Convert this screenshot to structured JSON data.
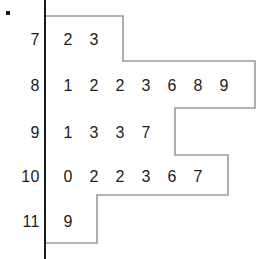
{
  "chart_data": {
    "type": "table",
    "title": "",
    "xlabel": "",
    "ylabel": "",
    "stem_unit": "",
    "rows": [
      {
        "stem": "7",
        "leaves": [
          "2",
          "3"
        ]
      },
      {
        "stem": "8",
        "leaves": [
          "1",
          "2",
          "2",
          "3",
          "6",
          "8",
          "9"
        ]
      },
      {
        "stem": "9",
        "leaves": [
          "1",
          "3",
          "3",
          "7"
        ]
      },
      {
        "stem": "10",
        "leaves": [
          "0",
          "2",
          "2",
          "3",
          "6",
          "7"
        ]
      },
      {
        "stem": "11",
        "leaves": [
          "9"
        ]
      }
    ],
    "counts": [
      2,
      7,
      4,
      6,
      1
    ],
    "values": [
      72,
      73,
      81,
      82,
      82,
      83,
      86,
      88,
      89,
      91,
      93,
      93,
      97,
      100,
      102,
      102,
      103,
      106,
      107,
      119
    ],
    "legend": [],
    "annotations": [],
    "grid": false
  },
  "plot": {
    "axis_color": "#1c1c1c",
    "outline_color": "#9a9a9a",
    "text_color": "#1c1c1c",
    "background": "#ffffff",
    "marker_color": "#1a1a1a"
  },
  "geometry": {
    "axis_x": 45,
    "axis_top": 0,
    "axis_bottom": 259,
    "leaf_start_x": 68,
    "leaf_step_x": 26,
    "row_y": [
      40,
      86,
      133,
      177,
      222
    ],
    "stem_label_right": 40,
    "outline_points": "45,16 123,16 123,61 255,61 255,108 175,108 175,155 228,155 228,195 97,195 97,243 45,243",
    "dot_x": 6,
    "dot_y": 11
  }
}
